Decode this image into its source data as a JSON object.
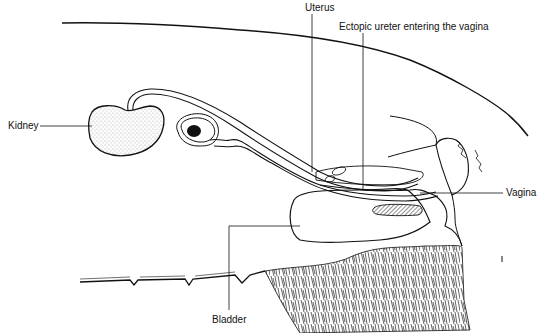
{
  "diagram": {
    "labels": {
      "kidney": "Kidney",
      "uterus": "Uterus",
      "ectopic_ureter": "Ectopic ureter entering the vagina",
      "vagina": "Vagina",
      "bladder": "Bladder"
    },
    "colors": {
      "line": "#111111",
      "background": "#ffffff",
      "stipple": "#555555",
      "hatch": "#333333"
    }
  }
}
